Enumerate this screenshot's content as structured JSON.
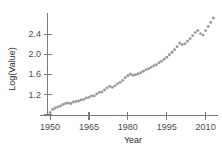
{
  "figure": {
    "width": 222,
    "height": 152,
    "background": "#ffffff",
    "clipped_title_fragment": "",
    "marker_color": "#9a9a9a",
    "axis_color": "#7b7b7b",
    "text_color": "#3a3a3a"
  },
  "chart_data": {
    "type": "scatter",
    "title": "",
    "xlabel": "Year",
    "ylabel": "Log(Value)",
    "xlim": [
      1949,
      2014
    ],
    "ylim": [
      0.78,
      2.82
    ],
    "xticks": [
      1950,
      1965,
      1980,
      1995,
      2010
    ],
    "xtick_labels": [
      "1950",
      "1965",
      "1980",
      "1995",
      "2010"
    ],
    "yticks": [
      0.8,
      1.2,
      1.6,
      2.0,
      2.4
    ],
    "ytick_labels": [
      "",
      "1.2",
      "1.6",
      "2.0",
      "2.4"
    ],
    "grid": false,
    "legend": false,
    "marker": "circle",
    "x": [
      1950,
      1951,
      1952,
      1953,
      1954,
      1955,
      1956,
      1957,
      1958,
      1959,
      1960,
      1961,
      1962,
      1963,
      1964,
      1965,
      1966,
      1967,
      1968,
      1969,
      1970,
      1971,
      1972,
      1973,
      1974,
      1975,
      1976,
      1977,
      1978,
      1979,
      1980,
      1981,
      1982,
      1983,
      1984,
      1985,
      1986,
      1987,
      1988,
      1989,
      1990,
      1991,
      1992,
      1993,
      1994,
      1995,
      1996,
      1997,
      1998,
      1999,
      2000,
      2001,
      2002,
      2003,
      2004,
      2005,
      2006,
      2007,
      2008,
      2009,
      2010,
      2011,
      2012,
      2013
    ],
    "y": [
      0.84,
      0.9,
      0.93,
      0.95,
      0.97,
      1.0,
      1.02,
      1.03,
      1.02,
      1.05,
      1.06,
      1.07,
      1.09,
      1.1,
      1.13,
      1.14,
      1.17,
      1.17,
      1.21,
      1.24,
      1.25,
      1.29,
      1.33,
      1.36,
      1.34,
      1.37,
      1.41,
      1.44,
      1.48,
      1.53,
      1.57,
      1.6,
      1.58,
      1.59,
      1.61,
      1.63,
      1.66,
      1.69,
      1.71,
      1.74,
      1.77,
      1.79,
      1.83,
      1.86,
      1.9,
      1.94,
      1.99,
      2.04,
      2.09,
      2.15,
      2.22,
      2.19,
      2.21,
      2.26,
      2.31,
      2.37,
      2.43,
      2.47,
      2.41,
      2.38,
      2.47,
      2.55,
      2.63,
      2.72
    ]
  }
}
